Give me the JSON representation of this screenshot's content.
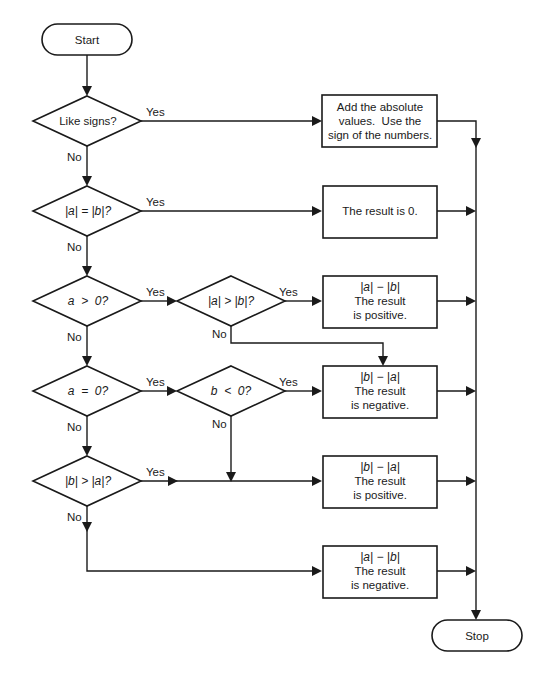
{
  "terminals": {
    "start": "Start",
    "stop": "Stop"
  },
  "decisions": {
    "like_signs": "Like signs?",
    "abs_equal": "|a| = |b|?",
    "a_positive": "a  >  0?",
    "abs_a_gt_abs_b": "|a| > |b|?",
    "a_zero": "a  =  0?",
    "b_negative": "b  <  0?",
    "abs_b_gt_abs_a": "|b| > |a|?"
  },
  "results": {
    "add_abs": [
      "Add the absolute",
      "values.  Use the",
      "sign of the numbers."
    ],
    "zero": [
      "The result is 0."
    ],
    "a_minus_b_pos": [
      "|a| − |b|",
      "The result",
      "is positive."
    ],
    "b_minus_a_neg": [
      "|b| − |a|",
      "The result",
      "is negative."
    ],
    "b_minus_a_pos": [
      "|b| − |a|",
      "The result",
      "is positive."
    ],
    "a_minus_b_neg": [
      "|a| − |b|",
      "The result",
      "is negative."
    ]
  },
  "branch_labels": {
    "yes": "Yes",
    "no": "No"
  }
}
